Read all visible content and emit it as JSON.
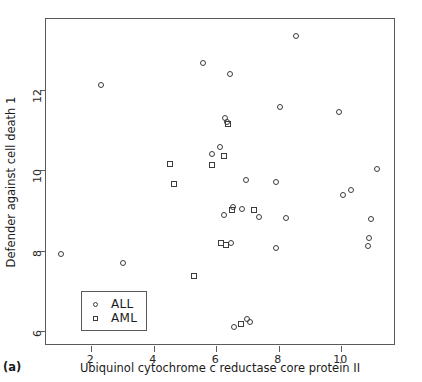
{
  "panel": {
    "label": "(a)"
  },
  "axes": {
    "x": {
      "title": "Ubiquinol cytochrome c reductase core protein II",
      "ticks": [
        2,
        4,
        6,
        8,
        10
      ],
      "lim": [
        0.55,
        11.75
      ]
    },
    "y": {
      "title": "Defender against cell death 1",
      "ticks": [
        6,
        8,
        10,
        12
      ],
      "lim": [
        5.62,
        13.78
      ]
    }
  },
  "legend": {
    "entries": [
      {
        "label": "ALL",
        "marker": "circle"
      },
      {
        "label": "AML",
        "marker": "square"
      }
    ]
  },
  "chart_data": {
    "type": "scatter",
    "title": "",
    "xlabel": "Ubiquinol cytochrome c reductase core protein II",
    "ylabel": "Defender against cell death 1",
    "xlim": [
      0.55,
      11.75
    ],
    "ylim": [
      5.62,
      13.78
    ],
    "xticks": [
      2,
      4,
      6,
      8,
      10
    ],
    "yticks": [
      6,
      8,
      10,
      12
    ],
    "grid": false,
    "legend_position": "bottom-left",
    "series": [
      {
        "name": "ALL",
        "marker": "circle",
        "points": [
          [
            2.31,
            12.14
          ],
          [
            5.58,
            12.69
          ],
          [
            6.44,
            12.41
          ],
          [
            8.56,
            13.35
          ],
          [
            8.03,
            11.58
          ],
          [
            9.94,
            11.45
          ],
          [
            6.29,
            11.3
          ],
          [
            6.33,
            11.22
          ],
          [
            5.86,
            10.4
          ],
          [
            6.13,
            10.59
          ],
          [
            6.94,
            9.76
          ],
          [
            7.92,
            9.71
          ],
          [
            10.3,
            9.51
          ],
          [
            10.06,
            9.39
          ],
          [
            11.14,
            10.03
          ],
          [
            6.52,
            9.08
          ],
          [
            6.25,
            8.9
          ],
          [
            6.81,
            9.05
          ],
          [
            7.37,
            8.83
          ],
          [
            8.22,
            8.81
          ],
          [
            6.47,
            8.18
          ],
          [
            7.91,
            8.06
          ],
          [
            10.94,
            8.78
          ],
          [
            10.9,
            8.32
          ],
          [
            10.86,
            8.12
          ],
          [
            3.02,
            7.69
          ],
          [
            1.02,
            7.92
          ],
          [
            6.97,
            6.3
          ],
          [
            7.09,
            6.23
          ],
          [
            6.58,
            6.1
          ]
        ]
      },
      {
        "name": "AML",
        "marker": "square",
        "points": [
          [
            6.37,
            11.16
          ],
          [
            6.26,
            10.36
          ],
          [
            5.85,
            10.14
          ],
          [
            4.53,
            10.17
          ],
          [
            4.66,
            9.66
          ],
          [
            6.5,
            9.01
          ],
          [
            7.22,
            9.01
          ],
          [
            6.16,
            8.19
          ],
          [
            6.3,
            8.13
          ],
          [
            5.27,
            7.36
          ],
          [
            6.79,
            6.18
          ]
        ]
      }
    ]
  }
}
